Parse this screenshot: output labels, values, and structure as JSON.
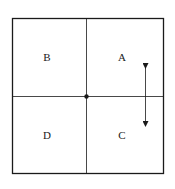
{
  "diagram": {
    "quadrants": [
      {
        "id": "B",
        "label": "B",
        "position": "top-left"
      },
      {
        "id": "A",
        "label": "A",
        "position": "top-right"
      },
      {
        "id": "D",
        "label": "D",
        "position": "bottom-left"
      },
      {
        "id": "C",
        "label": "C",
        "position": "bottom-right"
      }
    ],
    "center_point": "origin",
    "arrow": {
      "direction": "vertical-bidirectional",
      "spans": [
        "A",
        "C"
      ]
    },
    "colors": {
      "line": "#1a1a1a",
      "background": "#ffffff"
    }
  }
}
